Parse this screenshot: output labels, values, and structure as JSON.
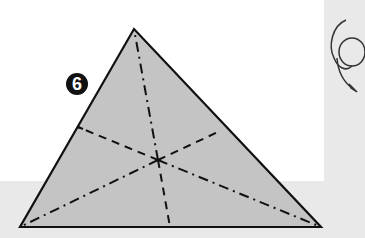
{
  "diagram": {
    "type": "origami-instruction-step",
    "step_number": "6",
    "colors": {
      "paper_fill": "#c4c4c4",
      "outline": "#111111",
      "background_panel": "#e9e9e9",
      "page": "#ffffff"
    },
    "shape": {
      "name": "triangle",
      "vertices": {
        "top": [
          134,
          29
        ],
        "bottom_left": [
          20,
          227
        ],
        "bottom_right": [
          321,
          227
        ]
      },
      "center": [
        158,
        160
      ]
    },
    "folds": {
      "valley_lines": [
        {
          "from": "center",
          "to": [
            78,
            127
          ]
        },
        {
          "from": "center",
          "to": [
            220,
            131
          ]
        },
        {
          "from": "center",
          "to": [
            170,
            227
          ]
        }
      ],
      "mountain_lines": [
        {
          "from": "center",
          "to": "top"
        },
        {
          "from": "center",
          "to": "bottom_left"
        },
        {
          "from": "center",
          "to": "bottom_right"
        }
      ]
    },
    "symbols": [
      {
        "name": "turn-over-arrow",
        "meaning": "rotate / turn model"
      }
    ]
  }
}
